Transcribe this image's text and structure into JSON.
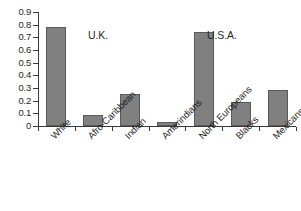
{
  "chart_data": {
    "type": "bar",
    "title": "",
    "subtitle": "",
    "xlabel": "",
    "ylabel": "",
    "ylim": [
      0,
      0.9
    ],
    "grid": false,
    "legend": "none",
    "categories": [
      "White",
      "Afro-Caribbean",
      "Indian",
      "Amerindians",
      "North Europeans",
      "Blacks",
      "Mexicans"
    ],
    "values": [
      0.78,
      0.09,
      0.25,
      0.03,
      0.74,
      0.19,
      0.285
    ],
    "ytick_labels": [
      "0",
      "0.1",
      "0.2",
      "0.3",
      "0.4",
      "0.5",
      "0.6",
      "0.7",
      "0.8",
      "0.9"
    ],
    "ytick_values": [
      0,
      0.1,
      0.2,
      0.3,
      0.4,
      0.5,
      0.6,
      0.7,
      0.8,
      0.9
    ],
    "annotations": [
      {
        "text": "U.K.",
        "group_categories": [
          "White",
          "Afro-Caribbean",
          "Indian"
        ]
      },
      {
        "text": "U.S.A.",
        "group_categories": [
          "Amerindians",
          "North Europeans",
          "Blacks",
          "Mexicans"
        ]
      }
    ],
    "colors": {
      "bar_fill": "#808080",
      "bar_border": "#5a5a5a",
      "axis": "#3a3a3a",
      "text": "#1f1f1f",
      "background": "#ffffff"
    }
  }
}
